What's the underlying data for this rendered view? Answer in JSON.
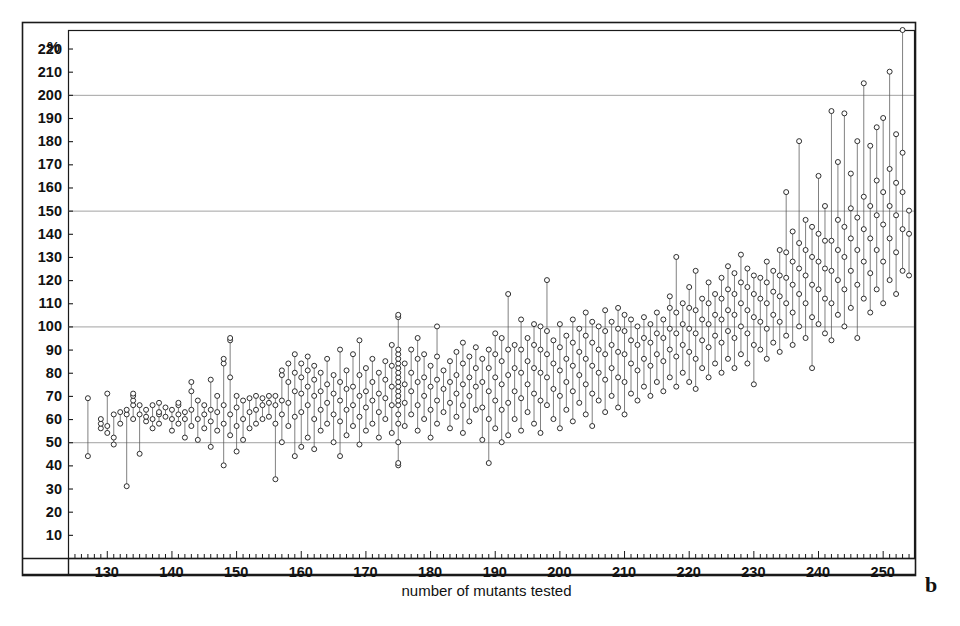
{
  "figure": {
    "panel_label": "b",
    "frame": {
      "x": 22,
      "y": 22,
      "width": 893,
      "height": 553
    },
    "plot_area": {
      "x": 68,
      "y": 30,
      "width": 847,
      "height": 528
    }
  },
  "chart_data": {
    "type": "scatter",
    "title": "",
    "subtitle": "",
    "xlabel": "number of mutants tested",
    "ylabel": "%",
    "xlim": [
      124,
      255
    ],
    "ylim": [
      0,
      228
    ],
    "grid": true,
    "grid_y": [
      50,
      100,
      150,
      200
    ],
    "legend": null,
    "x_tick_labels": [
      130,
      140,
      150,
      160,
      170,
      180,
      190,
      200,
      210,
      220,
      230,
      240,
      250
    ],
    "x_minor_tick_step": 1,
    "y_tick_labels": [
      10,
      20,
      30,
      40,
      50,
      60,
      70,
      80,
      90,
      100,
      110,
      120,
      130,
      140,
      150,
      160,
      170,
      180,
      190,
      200,
      210,
      220
    ],
    "y_tick_step": 10,
    "marker": "open-circle",
    "marker_size_px": 5,
    "connector": "vertical-line",
    "columns": [
      {
        "x": 127,
        "values": [
          44,
          69
        ]
      },
      {
        "x": 129,
        "values": [
          56,
          58,
          60
        ]
      },
      {
        "x": 130,
        "values": [
          54,
          57,
          71
        ]
      },
      {
        "x": 131,
        "values": [
          49,
          52,
          62
        ]
      },
      {
        "x": 132,
        "values": [
          58,
          63
        ]
      },
      {
        "x": 133,
        "values": [
          31,
          62,
          64
        ]
      },
      {
        "x": 134,
        "values": [
          60,
          66,
          68,
          70,
          71
        ]
      },
      {
        "x": 135,
        "values": [
          45,
          62,
          66
        ]
      },
      {
        "x": 136,
        "values": [
          59,
          61,
          64
        ]
      },
      {
        "x": 137,
        "values": [
          56,
          60,
          66
        ]
      },
      {
        "x": 138,
        "values": [
          58,
          62,
          63,
          67
        ]
      },
      {
        "x": 139,
        "values": [
          61,
          65
        ]
      },
      {
        "x": 140,
        "values": [
          55,
          60,
          64
        ]
      },
      {
        "x": 141,
        "values": [
          58,
          62,
          66,
          67
        ]
      },
      {
        "x": 142,
        "values": [
          52,
          60,
          63
        ]
      },
      {
        "x": 143,
        "values": [
          57,
          64,
          72,
          76
        ]
      },
      {
        "x": 144,
        "values": [
          51,
          60,
          68
        ]
      },
      {
        "x": 145,
        "values": [
          56,
          62,
          66
        ]
      },
      {
        "x": 146,
        "values": [
          48,
          59,
          64,
          77
        ]
      },
      {
        "x": 147,
        "values": [
          55,
          63,
          70
        ]
      },
      {
        "x": 148,
        "values": [
          40,
          58,
          66,
          84,
          86
        ]
      },
      {
        "x": 149,
        "values": [
          53,
          62,
          78,
          94,
          95
        ]
      },
      {
        "x": 150,
        "values": [
          46,
          57,
          65,
          70
        ]
      },
      {
        "x": 151,
        "values": [
          51,
          60,
          68
        ]
      },
      {
        "x": 152,
        "values": [
          56,
          63,
          69
        ]
      },
      {
        "x": 153,
        "values": [
          58,
          64,
          70
        ]
      },
      {
        "x": 154,
        "values": [
          60,
          66,
          69
        ]
      },
      {
        "x": 155,
        "values": [
          61,
          67,
          70
        ]
      },
      {
        "x": 156,
        "values": [
          34,
          58,
          66,
          70
        ]
      },
      {
        "x": 157,
        "values": [
          50,
          62,
          68,
          79,
          81
        ]
      },
      {
        "x": 158,
        "values": [
          57,
          67,
          76,
          84
        ]
      },
      {
        "x": 159,
        "values": [
          44,
          61,
          72,
          80,
          88
        ]
      },
      {
        "x": 160,
        "values": [
          48,
          63,
          71,
          78,
          84
        ]
      },
      {
        "x": 161,
        "values": [
          52,
          66,
          74,
          81,
          87
        ]
      },
      {
        "x": 162,
        "values": [
          47,
          60,
          70,
          77,
          83
        ]
      },
      {
        "x": 163,
        "values": [
          55,
          64,
          72,
          80
        ]
      },
      {
        "x": 164,
        "values": [
          58,
          67,
          75,
          86
        ]
      },
      {
        "x": 165,
        "values": [
          50,
          62,
          71,
          79
        ]
      },
      {
        "x": 166,
        "values": [
          44,
          59,
          68,
          76,
          90
        ]
      },
      {
        "x": 167,
        "values": [
          53,
          64,
          73,
          81
        ]
      },
      {
        "x": 168,
        "values": [
          57,
          66,
          74,
          88
        ]
      },
      {
        "x": 169,
        "values": [
          49,
          61,
          70,
          79,
          94
        ]
      },
      {
        "x": 170,
        "values": [
          55,
          65,
          72,
          82
        ]
      },
      {
        "x": 171,
        "values": [
          58,
          68,
          76,
          86
        ]
      },
      {
        "x": 172,
        "values": [
          52,
          63,
          71,
          80
        ]
      },
      {
        "x": 173,
        "values": [
          60,
          69,
          77,
          85
        ]
      },
      {
        "x": 174,
        "values": [
          54,
          66,
          74,
          83,
          92
        ]
      },
      {
        "x": 175,
        "values": [
          40,
          41,
          50,
          58,
          62,
          66,
          68,
          70,
          72,
          74,
          76,
          78,
          80,
          82,
          84,
          86,
          88,
          90,
          104,
          105
        ]
      },
      {
        "x": 176,
        "values": [
          57,
          67,
          75,
          84
        ]
      },
      {
        "x": 177,
        "values": [
          62,
          72,
          80,
          90
        ]
      },
      {
        "x": 178,
        "values": [
          55,
          66,
          76,
          86,
          95
        ]
      },
      {
        "x": 179,
        "values": [
          60,
          70,
          78,
          88
        ]
      },
      {
        "x": 180,
        "values": [
          52,
          64,
          74,
          83
        ]
      },
      {
        "x": 181,
        "values": [
          58,
          68,
          77,
          87,
          100
        ]
      },
      {
        "x": 182,
        "values": [
          63,
          73,
          81
        ]
      },
      {
        "x": 183,
        "values": [
          56,
          67,
          76,
          85
        ]
      },
      {
        "x": 184,
        "values": [
          61,
          71,
          79,
          89
        ]
      },
      {
        "x": 185,
        "values": [
          54,
          66,
          75,
          84,
          93
        ]
      },
      {
        "x": 186,
        "values": [
          59,
          70,
          78,
          87
        ]
      },
      {
        "x": 187,
        "values": [
          64,
          74,
          82,
          91
        ]
      },
      {
        "x": 188,
        "values": [
          51,
          65,
          76,
          86
        ]
      },
      {
        "x": 189,
        "values": [
          41,
          60,
          72,
          82,
          90
        ]
      },
      {
        "x": 190,
        "values": [
          56,
          68,
          78,
          88,
          97
        ]
      },
      {
        "x": 191,
        "values": [
          50,
          64,
          75,
          85,
          95
        ]
      },
      {
        "x": 192,
        "values": [
          53,
          67,
          79,
          90,
          114
        ]
      },
      {
        "x": 193,
        "values": [
          60,
          72,
          82,
          92
        ]
      },
      {
        "x": 194,
        "values": [
          55,
          69,
          80,
          90,
          103
        ]
      },
      {
        "x": 195,
        "values": [
          63,
          75,
          85,
          95
        ]
      },
      {
        "x": 196,
        "values": [
          58,
          71,
          82,
          92,
          101
        ]
      },
      {
        "x": 197,
        "values": [
          54,
          68,
          80,
          90,
          100
        ]
      },
      {
        "x": 198,
        "values": [
          66,
          78,
          88,
          98,
          120
        ]
      },
      {
        "x": 199,
        "values": [
          60,
          73,
          84,
          94
        ]
      },
      {
        "x": 200,
        "values": [
          56,
          70,
          81,
          91,
          101
        ]
      },
      {
        "x": 201,
        "values": [
          64,
          76,
          86,
          96
        ]
      },
      {
        "x": 202,
        "values": [
          59,
          72,
          83,
          93,
          103
        ]
      },
      {
        "x": 203,
        "values": [
          67,
          79,
          89,
          99
        ]
      },
      {
        "x": 204,
        "values": [
          62,
          75,
          86,
          96,
          106
        ]
      },
      {
        "x": 205,
        "values": [
          57,
          71,
          83,
          93,
          102
        ]
      },
      {
        "x": 206,
        "values": [
          68,
          80,
          90,
          100
        ]
      },
      {
        "x": 207,
        "values": [
          63,
          77,
          88,
          98,
          107
        ]
      },
      {
        "x": 208,
        "values": [
          70,
          82,
          92,
          102
        ]
      },
      {
        "x": 209,
        "values": [
          65,
          78,
          89,
          99,
          108
        ]
      },
      {
        "x": 210,
        "values": [
          62,
          76,
          88,
          98,
          105
        ]
      },
      {
        "x": 211,
        "values": [
          71,
          84,
          94,
          103
        ]
      },
      {
        "x": 212,
        "values": [
          68,
          81,
          92,
          100
        ]
      },
      {
        "x": 213,
        "values": [
          74,
          86,
          95,
          104
        ]
      },
      {
        "x": 214,
        "values": [
          70,
          83,
          93,
          101
        ]
      },
      {
        "x": 215,
        "values": [
          76,
          88,
          97,
          106
        ]
      },
      {
        "x": 216,
        "values": [
          72,
          85,
          95,
          103
        ]
      },
      {
        "x": 217,
        "values": [
          78,
          90,
          99,
          108,
          113
        ]
      },
      {
        "x": 218,
        "values": [
          74,
          87,
          97,
          106,
          130
        ]
      },
      {
        "x": 219,
        "values": [
          80,
          92,
          101,
          110
        ]
      },
      {
        "x": 220,
        "values": [
          76,
          89,
          99,
          108,
          117
        ]
      },
      {
        "x": 221,
        "values": [
          73,
          86,
          97,
          107,
          124
        ]
      },
      {
        "x": 222,
        "values": [
          82,
          94,
          103,
          112
        ]
      },
      {
        "x": 223,
        "values": [
          78,
          91,
          101,
          110,
          119
        ]
      },
      {
        "x": 224,
        "values": [
          84,
          96,
          105,
          114
        ]
      },
      {
        "x": 225,
        "values": [
          80,
          93,
          103,
          112,
          121
        ]
      },
      {
        "x": 226,
        "values": [
          86,
          98,
          107,
          116,
          126
        ]
      },
      {
        "x": 227,
        "values": [
          82,
          95,
          105,
          114,
          123
        ]
      },
      {
        "x": 228,
        "values": [
          88,
          100,
          110,
          119,
          131
        ]
      },
      {
        "x": 229,
        "values": [
          84,
          97,
          107,
          117,
          125
        ]
      },
      {
        "x": 230,
        "values": [
          75,
          92,
          104,
          114,
          122
        ]
      },
      {
        "x": 231,
        "values": [
          90,
          102,
          112,
          121
        ]
      },
      {
        "x": 232,
        "values": [
          86,
          99,
          110,
          119,
          128
        ]
      },
      {
        "x": 233,
        "values": [
          93,
          105,
          115,
          124
        ]
      },
      {
        "x": 234,
        "values": [
          89,
          102,
          113,
          122,
          133
        ]
      },
      {
        "x": 235,
        "values": [
          96,
          110,
          121,
          132,
          158
        ]
      },
      {
        "x": 236,
        "values": [
          92,
          106,
          118,
          128,
          141
        ]
      },
      {
        "x": 237,
        "values": [
          100,
          114,
          125,
          136,
          180
        ]
      },
      {
        "x": 238,
        "values": [
          95,
          110,
          122,
          133,
          146
        ]
      },
      {
        "x": 239,
        "values": [
          82,
          104,
          118,
          130,
          143
        ]
      },
      {
        "x": 240,
        "values": [
          101,
          116,
          128,
          140,
          165
        ]
      },
      {
        "x": 241,
        "values": [
          97,
          112,
          125,
          137,
          152
        ]
      },
      {
        "x": 242,
        "values": [
          94,
          110,
          124,
          137,
          193
        ]
      },
      {
        "x": 243,
        "values": [
          105,
          120,
          133,
          146,
          171
        ]
      },
      {
        "x": 244,
        "values": [
          100,
          116,
          130,
          143,
          192
        ]
      },
      {
        "x": 245,
        "values": [
          108,
          124,
          138,
          151,
          166
        ]
      },
      {
        "x": 246,
        "values": [
          95,
          118,
          133,
          147,
          180
        ]
      },
      {
        "x": 247,
        "values": [
          112,
          128,
          142,
          156,
          205
        ]
      },
      {
        "x": 248,
        "values": [
          106,
          123,
          138,
          152,
          178
        ]
      },
      {
        "x": 249,
        "values": [
          116,
          133,
          148,
          163,
          186
        ]
      },
      {
        "x": 250,
        "values": [
          110,
          128,
          144,
          158,
          190
        ]
      },
      {
        "x": 251,
        "values": [
          120,
          138,
          152,
          168,
          210
        ]
      },
      {
        "x": 252,
        "values": [
          114,
          132,
          148,
          162,
          183
        ]
      },
      {
        "x": 253,
        "values": [
          124,
          142,
          158,
          175,
          228
        ]
      },
      {
        "x": 254,
        "values": [
          122,
          140,
          150
        ]
      }
    ]
  }
}
